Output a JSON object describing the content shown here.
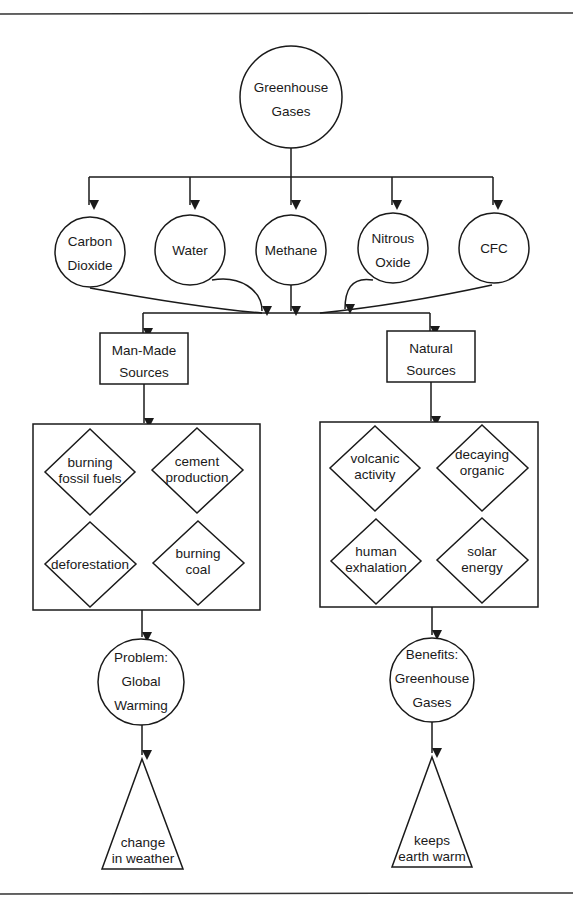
{
  "diagram": {
    "root": {
      "lines": [
        "Greenhouse",
        "Gases"
      ]
    },
    "gases": [
      {
        "id": "carbon-dioxide",
        "lines": [
          "Carbon",
          "Dioxide"
        ]
      },
      {
        "id": "water",
        "lines": [
          "Water"
        ]
      },
      {
        "id": "methane",
        "lines": [
          "Methane"
        ]
      },
      {
        "id": "nitrous-oxide",
        "lines": [
          "Nitrous",
          "Oxide"
        ]
      },
      {
        "id": "cfc",
        "lines": [
          "CFC"
        ]
      }
    ],
    "sources": {
      "man_made": {
        "lines": [
          "Man-Made",
          "Sources"
        ],
        "items": [
          {
            "lines": [
              "burning",
              "fossil fuels"
            ]
          },
          {
            "lines": [
              "cement",
              "production"
            ]
          },
          {
            "lines": [
              "deforestation"
            ]
          },
          {
            "lines": [
              "burning",
              "coal"
            ]
          }
        ],
        "outcome": {
          "lines": [
            "Problem:",
            "Global",
            "Warming"
          ]
        },
        "result": {
          "lines": [
            "change",
            "in weather"
          ]
        }
      },
      "natural": {
        "lines": [
          "Natural",
          "Sources"
        ],
        "items": [
          {
            "lines": [
              "volcanic",
              "activity"
            ]
          },
          {
            "lines": [
              "decaying",
              "organic",
              "matter"
            ]
          },
          {
            "lines": [
              "human",
              "exhalation"
            ]
          },
          {
            "lines": [
              "solar",
              "energy"
            ]
          }
        ],
        "outcome": {
          "lines": [
            "Benefits:",
            "Greenhouse",
            "Gases"
          ]
        },
        "result": {
          "lines": [
            "keeps",
            "earth warm"
          ]
        }
      }
    }
  },
  "colors": {
    "stroke": "#1a1a1a",
    "background": "#ffffff"
  }
}
